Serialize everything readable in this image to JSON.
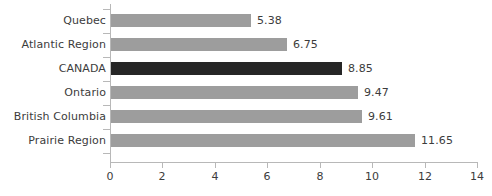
{
  "chart_data": {
    "type": "bar",
    "orientation": "horizontal",
    "title": "",
    "xlabel": "",
    "ylabel": "",
    "categories": [
      "Quebec",
      "Atlantic Region",
      "CANADA",
      "Ontario",
      "British Columbia",
      "Prairie Region"
    ],
    "values": [
      5.38,
      6.75,
      8.85,
      9.47,
      9.61,
      11.65
    ],
    "value_labels": [
      "5.38",
      "6.75",
      "8.85",
      "9.47",
      "9.61",
      "11.65"
    ],
    "highlight_category": "CANADA",
    "xlim": [
      0,
      14
    ],
    "xticks": [
      0,
      2,
      4,
      6,
      8,
      10,
      12,
      14
    ],
    "xtick_labels": [
      "0",
      "2",
      "4",
      "6",
      "8",
      "10",
      "12",
      "14"
    ],
    "grid": false,
    "legend": null,
    "colors": {
      "bar": "#9d9d9d",
      "bar_highlight": "#262626",
      "axis": "#b8b8b8",
      "text": "#3c3c3c",
      "background": "#ffffff"
    }
  }
}
